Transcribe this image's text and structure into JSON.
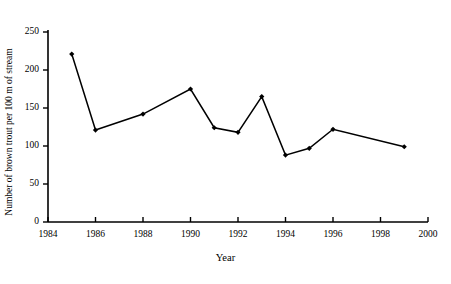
{
  "chart_data": {
    "type": "line",
    "title": "",
    "xlabel": "Year",
    "ylabel": "Number of brown trout per 100 m of stream",
    "xlim": [
      1984,
      2000
    ],
    "ylim": [
      0,
      250
    ],
    "xticks": [
      1984,
      1986,
      1988,
      1990,
      1992,
      1994,
      1996,
      1998,
      2000
    ],
    "xtick_labels": [
      "1984",
      "1986",
      "1988",
      "1990",
      "1992",
      "1994",
      "1996",
      "1998",
      "2000"
    ],
    "yticks": [
      0,
      50,
      100,
      150,
      200,
      250
    ],
    "ytick_labels": [
      "0",
      "50",
      "100",
      "150",
      "200",
      "250"
    ],
    "grid": false,
    "legend": false,
    "marker": "diamond",
    "line_color": "#000000",
    "marker_color": "#000000",
    "background_color": "#ffffff",
    "x": [
      1985,
      1986,
      1988,
      1990,
      1991,
      1992,
      1993,
      1994,
      1995,
      1996,
      1999
    ],
    "values": [
      221,
      121,
      142,
      175,
      124,
      118,
      165,
      88,
      97,
      122,
      99
    ],
    "points": [
      {
        "year": 1985,
        "value": 221
      },
      {
        "year": 1986,
        "value": 121
      },
      {
        "year": 1988,
        "value": 142
      },
      {
        "year": 1990,
        "value": 175
      },
      {
        "year": 1991,
        "value": 124
      },
      {
        "year": 1992,
        "value": 118
      },
      {
        "year": 1993,
        "value": 165
      },
      {
        "year": 1994,
        "value": 88
      },
      {
        "year": 1995,
        "value": 97
      },
      {
        "year": 1996,
        "value": 122
      },
      {
        "year": 1999,
        "value": 99
      }
    ]
  }
}
